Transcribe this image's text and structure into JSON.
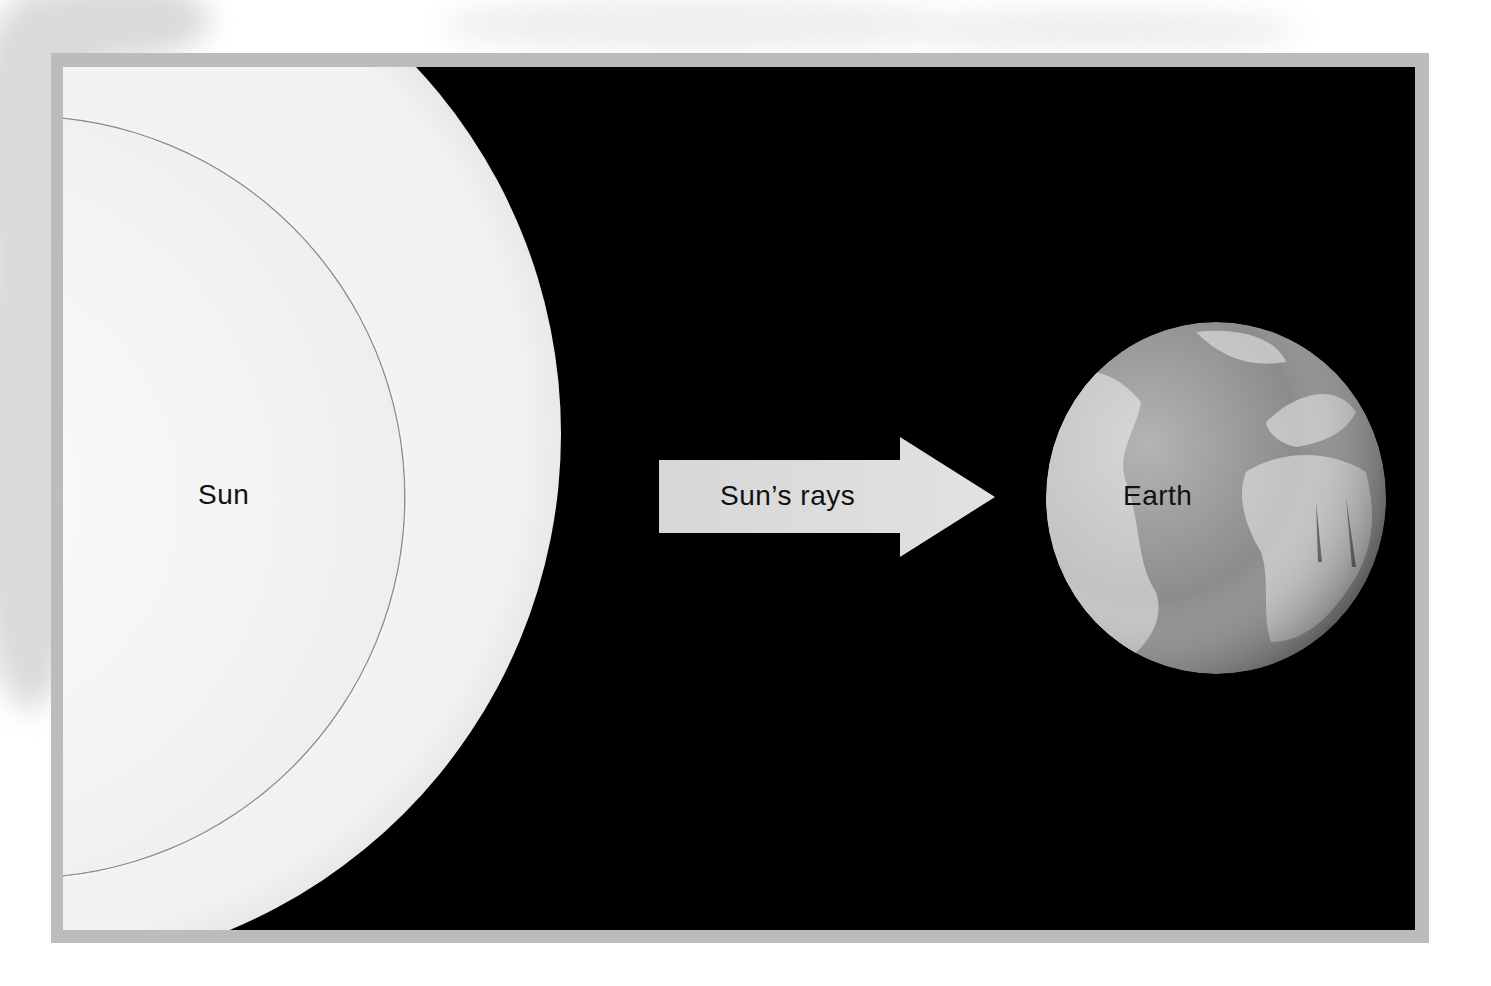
{
  "diagram": {
    "type": "sun-earth-radiation",
    "colors": {
      "frame": "#bcbcbc",
      "space": "#000000",
      "sun": "#f3f3f3",
      "arrow": "#d9d9d9",
      "earth_ocean": "#8a8a8a",
      "earth_land": "#bdbdbd",
      "text": "#111111"
    },
    "nodes": [
      {
        "id": "sun",
        "label": "Sun"
      },
      {
        "id": "earth",
        "label": "Earth"
      }
    ],
    "edges": [
      {
        "from": "sun",
        "to": "earth",
        "label": "Sun’s rays",
        "icon": "right-arrow-icon"
      }
    ]
  },
  "labels": {
    "sun": "Sun",
    "rays": "Sun’s rays",
    "earth": "Earth"
  }
}
